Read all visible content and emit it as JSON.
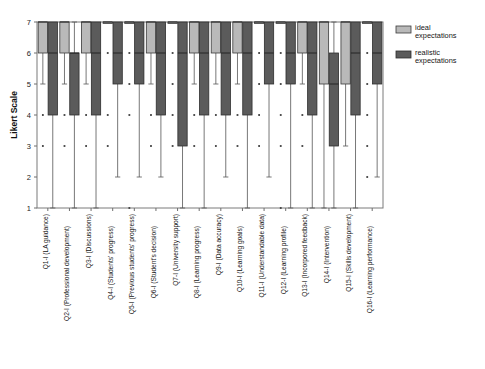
{
  "chart_data": {
    "type": "box",
    "title": "",
    "xlabel": "",
    "ylabel": "Likert Scale",
    "ylim": [
      1,
      7
    ],
    "yticks": [
      1,
      2,
      3,
      4,
      5,
      6,
      7
    ],
    "grid": false,
    "legend_position": "right",
    "colors": {
      "ideal": "#b9b9b9",
      "realistic": "#5b5b5b",
      "frame": "#7a7a7a",
      "text": "#161616"
    },
    "legend": [
      {
        "name": "ideal expectations",
        "line1": "ideal",
        "line2": "expectations",
        "color": "#b9b9b9"
      },
      {
        "name": "realistic expectations",
        "line1": "realistic",
        "line2": "expectations",
        "color": "#5b5b5b"
      }
    ],
    "categories": [
      "Q1-I (LA guidance)",
      "Q2-I (Professional development)",
      "Q3-I (Discussions)",
      "Q4-I (Students' progress)",
      "Q5-I (Previous students' progress)",
      "Q6-I (Student's decision)",
      "Q7-I (University support)",
      "Q8-I (Learning progress)",
      "Q9-I (Data accuracy)",
      "Q10-I (Learning goals)",
      "Q11-I (Understandable data)",
      "Q12-I (Learning profile)",
      "Q13-I (Incorpored feedback)",
      "Q14-I (Intervention)",
      "Q15-I (Skills development)",
      "Q16-I (Learning performance)"
    ],
    "series": [
      {
        "name": "ideal expectations",
        "color": "#b9b9b9",
        "boxes": [
          {
            "q1": 6,
            "median": 7,
            "q3": 7,
            "low": 5,
            "high": 7,
            "outliers": [
              4,
              3
            ]
          },
          {
            "q1": 6,
            "median": 7,
            "q3": 7,
            "low": 5,
            "high": 7,
            "outliers": [
              4,
              3
            ]
          },
          {
            "q1": 6,
            "median": 7,
            "q3": 7,
            "low": 5,
            "high": 7,
            "outliers": [
              4,
              3
            ]
          },
          {
            "q1": 7,
            "median": 7,
            "q3": 7,
            "low": 7,
            "high": 7,
            "outliers": [
              6,
              4,
              3
            ]
          },
          {
            "q1": 7,
            "median": 7,
            "q3": 7,
            "low": 7,
            "high": 7,
            "outliers": [
              6,
              5,
              4,
              1
            ]
          },
          {
            "q1": 6,
            "median": 7,
            "q3": 7,
            "low": 5,
            "high": 7,
            "outliers": [
              4,
              3
            ]
          },
          {
            "q1": 7,
            "median": 7,
            "q3": 7,
            "low": 7,
            "high": 7,
            "outliers": [
              6,
              5,
              4,
              3
            ]
          },
          {
            "q1": 6,
            "median": 7,
            "q3": 7,
            "low": 5,
            "high": 7,
            "outliers": [
              4,
              3
            ]
          },
          {
            "q1": 6,
            "median": 7,
            "q3": 7,
            "low": 5,
            "high": 7,
            "outliers": [
              4,
              3
            ]
          },
          {
            "q1": 6,
            "median": 7,
            "q3": 7,
            "low": 5,
            "high": 7,
            "outliers": [
              4,
              3
            ]
          },
          {
            "q1": 7,
            "median": 7,
            "q3": 7,
            "low": 7,
            "high": 7,
            "outliers": [
              6,
              5,
              4,
              3
            ]
          },
          {
            "q1": 7,
            "median": 7,
            "q3": 7,
            "low": 7,
            "high": 7,
            "outliers": [
              6,
              5,
              4,
              3,
              1
            ]
          },
          {
            "q1": 6,
            "median": 7,
            "q3": 7,
            "low": 5,
            "high": 7,
            "outliers": [
              4,
              3
            ]
          },
          {
            "q1": 5,
            "median": 7,
            "q3": 7,
            "low": 1,
            "high": 7,
            "outliers": []
          },
          {
            "q1": 5,
            "median": 7,
            "q3": 7,
            "low": 3,
            "high": 7,
            "outliers": []
          },
          {
            "q1": 7,
            "median": 7,
            "q3": 7,
            "low": 7,
            "high": 7,
            "outliers": [
              6,
              5,
              4,
              3,
              2
            ]
          }
        ]
      },
      {
        "name": "realistic expectations",
        "color": "#5b5b5b",
        "boxes": [
          {
            "q1": 4,
            "median": 6,
            "q3": 7,
            "low": 1,
            "high": 7,
            "outliers": []
          },
          {
            "q1": 4,
            "median": 6,
            "q3": 6,
            "low": 1,
            "high": 7,
            "outliers": []
          },
          {
            "q1": 4,
            "median": 6,
            "q3": 7,
            "low": 1,
            "high": 7,
            "outliers": []
          },
          {
            "q1": 5,
            "median": 6,
            "q3": 7,
            "low": 2,
            "high": 7,
            "outliers": []
          },
          {
            "q1": 5,
            "median": 6,
            "q3": 7,
            "low": 2,
            "high": 7,
            "outliers": []
          },
          {
            "q1": 4,
            "median": 6,
            "q3": 7,
            "low": 2,
            "high": 7,
            "outliers": []
          },
          {
            "q1": 3,
            "median": 6,
            "q3": 7,
            "low": 1,
            "high": 7,
            "outliers": []
          },
          {
            "q1": 4,
            "median": 6,
            "q3": 7,
            "low": 1,
            "high": 7,
            "outliers": []
          },
          {
            "q1": 4,
            "median": 6,
            "q3": 7,
            "low": 2,
            "high": 7,
            "outliers": []
          },
          {
            "q1": 4,
            "median": 6,
            "q3": 7,
            "low": 1,
            "high": 7,
            "outliers": []
          },
          {
            "q1": 5,
            "median": 6,
            "q3": 7,
            "low": 2,
            "high": 7,
            "outliers": []
          },
          {
            "q1": 5,
            "median": 6,
            "q3": 7,
            "low": 1,
            "high": 7,
            "outliers": []
          },
          {
            "q1": 4,
            "median": 6,
            "q3": 7,
            "low": 1,
            "high": 7,
            "outliers": []
          },
          {
            "q1": 3,
            "median": 5,
            "q3": 6,
            "low": 1,
            "high": 7,
            "outliers": []
          },
          {
            "q1": 4,
            "median": 6,
            "q3": 7,
            "low": 1,
            "high": 7,
            "outliers": []
          },
          {
            "q1": 5,
            "median": 6,
            "q3": 7,
            "low": 2,
            "high": 7,
            "outliers": []
          }
        ]
      }
    ]
  }
}
